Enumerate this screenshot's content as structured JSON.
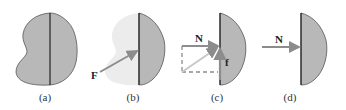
{
  "panels": [
    {
      "id": "a",
      "label": "(a)"
    },
    {
      "id": "b",
      "label": "(b)",
      "force_label": "F"
    },
    {
      "id": "c",
      "label": "(c)",
      "normal_label": "N",
      "friction_label": "f"
    },
    {
      "id": "d",
      "label": "(d)",
      "normal_label": "N"
    }
  ],
  "colors": {
    "body_fill": "#b8b8b8",
    "faded_fill": "#ececec",
    "outline": "#555555",
    "divider": "#222222",
    "arrow": "#8c8c8c"
  }
}
